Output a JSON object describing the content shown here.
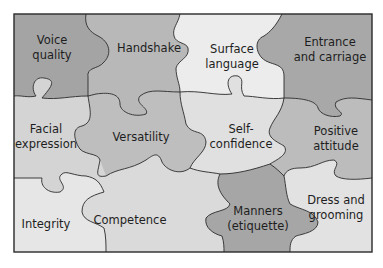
{
  "diagram": {
    "type": "jigsaw-puzzle",
    "colors": {
      "dark": "#a4a4a4",
      "mid": "#c6c6c6",
      "light": "#e4e4e4",
      "lightest": "#ececec",
      "outline": "#2a2a2a"
    },
    "pieces": [
      {
        "id": "voice-quality",
        "line1": "Voice",
        "line2": "quality",
        "shade": "dark"
      },
      {
        "id": "handshake",
        "line1": "Handshake",
        "line2": "",
        "shade": "mid"
      },
      {
        "id": "surface-language",
        "line1": "Surface",
        "line2": "language",
        "shade": "lightest"
      },
      {
        "id": "entrance-and-carriage",
        "line1": "Entrance",
        "line2": "and carriage",
        "shade": "dark"
      },
      {
        "id": "facial-expression",
        "line1": "Facial",
        "line2": "expression",
        "shade": "light"
      },
      {
        "id": "versatility",
        "line1": "Versatility",
        "line2": "",
        "shade": "mid"
      },
      {
        "id": "self-confidence",
        "line1": "Self-",
        "line2": "confidence",
        "shade": "light"
      },
      {
        "id": "positive-attitude",
        "line1": "Positive",
        "line2": "attitude",
        "shade": "mid"
      },
      {
        "id": "integrity",
        "line1": "Integrity",
        "line2": "",
        "shade": "lightest"
      },
      {
        "id": "competence",
        "line1": "Competence",
        "line2": "",
        "shade": "light"
      },
      {
        "id": "manners-etiquette",
        "line1": "Manners",
        "line2": "(etiquette)",
        "shade": "dark"
      },
      {
        "id": "dress-and-grooming",
        "line1": "Dress and",
        "line2": "grooming",
        "shade": "light"
      }
    ]
  }
}
